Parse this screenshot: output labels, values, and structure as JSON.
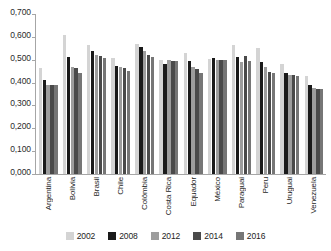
{
  "chart_data": {
    "type": "bar",
    "title": "",
    "subtitle": "",
    "xlabel": "",
    "ylabel": "",
    "ylim": [
      0.0,
      0.7
    ],
    "y_tick_step": 0.1,
    "grid": false,
    "legend_position": "bottom",
    "decimal_separator": ",",
    "y_tick_labels": [
      "0,700",
      "0,600",
      "0,500",
      "0,400",
      "0,300",
      "0,200",
      "0,100",
      "0,000"
    ],
    "y_tick_values": [
      0.7,
      0.6,
      0.5,
      0.4,
      0.3,
      0.2,
      0.1,
      0.0
    ],
    "categories": [
      "Argentina",
      "Bolívia",
      "Brasil",
      "Chile",
      "Colômbia",
      "Costa Rica",
      "Equador",
      "México",
      "Paraguai",
      "Peru",
      "Uruguai",
      "Venezuela"
    ],
    "series": [
      {
        "name": "2002",
        "color": "#d4d4d4",
        "values": [
          0.462,
          0.61,
          0.565,
          0.508,
          0.567,
          0.497,
          0.531,
          0.505,
          0.565,
          0.552,
          0.481,
          0.429
        ]
      },
      {
        "name": "2008",
        "color": "#1a1a1a",
        "values": [
          0.411,
          0.512,
          0.538,
          0.473,
          0.556,
          0.483,
          0.494,
          0.508,
          0.513,
          0.489,
          0.442,
          0.389
        ]
      },
      {
        "name": "2012",
        "color": "#9d9d9d",
        "values": [
          0.389,
          0.47,
          0.521,
          0.47,
          0.537,
          0.497,
          0.468,
          0.5,
          0.489,
          0.47,
          0.434,
          0.377
        ]
      },
      {
        "name": "2014",
        "color": "#4a4a4a",
        "values": [
          0.389,
          0.466,
          0.515,
          0.463,
          0.522,
          0.496,
          0.461,
          0.5,
          0.517,
          0.447,
          0.434,
          0.373
        ]
      },
      {
        "name": "2016",
        "color": "#767676",
        "values": [
          0.389,
          0.441,
          0.508,
          0.45,
          0.511,
          0.494,
          0.443,
          0.5,
          0.494,
          0.444,
          0.429,
          0.37
        ]
      }
    ]
  }
}
